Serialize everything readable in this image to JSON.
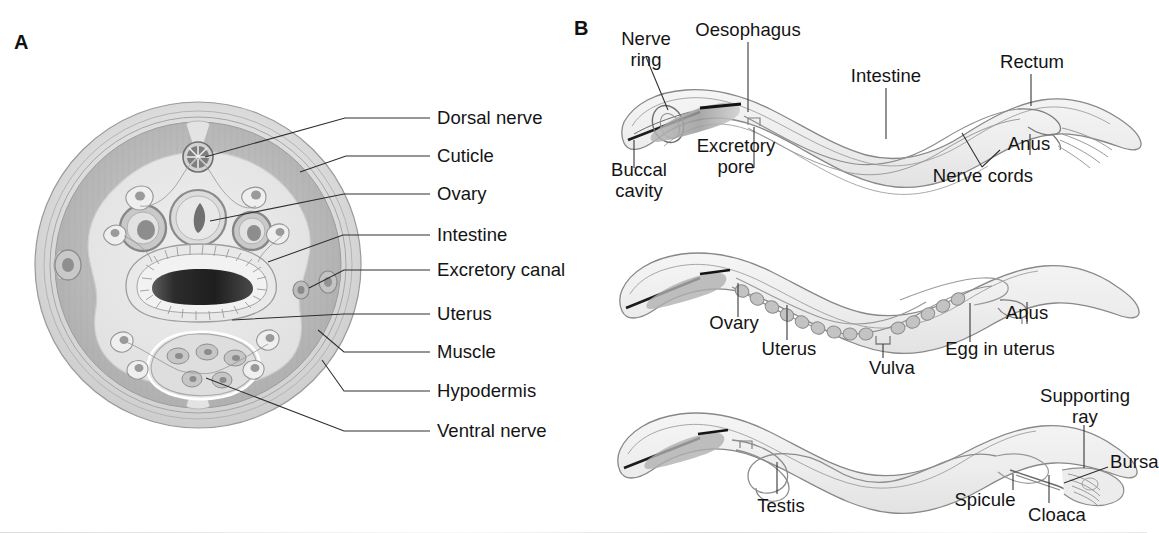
{
  "figure": {
    "background": "#ffffff",
    "panels": [
      {
        "letter": "A",
        "name": "nematode-cross-section",
        "labels": [
          {
            "key": "dorsal_nerve",
            "text": "Dorsal nerve"
          },
          {
            "key": "cuticle",
            "text": "Cuticle"
          },
          {
            "key": "ovary",
            "text": "Ovary"
          },
          {
            "key": "intestine",
            "text": "Intestine"
          },
          {
            "key": "excretory_canal",
            "text": "Excretory canal"
          },
          {
            "key": "uterus",
            "text": "Uterus"
          },
          {
            "key": "muscle",
            "text": "Muscle"
          },
          {
            "key": "hypodermis",
            "text": "Hypodermis"
          },
          {
            "key": "ventral_nerve",
            "text": "Ventral nerve"
          }
        ]
      },
      {
        "letter": "B",
        "name": "nematode-whole-worms",
        "worms": [
          {
            "key": "general-anatomy-worm",
            "labels": [
              {
                "key": "nerve_ring",
                "text": "Nerve\nring"
              },
              {
                "key": "oesophagus",
                "text": "Oesophagus"
              },
              {
                "key": "intestine",
                "text": "Intestine"
              },
              {
                "key": "rectum",
                "text": "Rectum"
              },
              {
                "key": "buccal_cavity",
                "text": "Buccal\ncavity"
              },
              {
                "key": "excretory_pore",
                "text": "Excretory\npore"
              },
              {
                "key": "nerve_cords",
                "text": "Nerve cords"
              },
              {
                "key": "anus",
                "text": "Anus"
              }
            ]
          },
          {
            "key": "female-worm",
            "labels": [
              {
                "key": "ovary",
                "text": "Ovary"
              },
              {
                "key": "uterus",
                "text": "Uterus"
              },
              {
                "key": "vulva",
                "text": "Vulva"
              },
              {
                "key": "egg_in_uterus",
                "text": "Egg in uterus"
              },
              {
                "key": "anus",
                "text": "Anus"
              }
            ]
          },
          {
            "key": "male-worm",
            "labels": [
              {
                "key": "testis",
                "text": "Testis"
              },
              {
                "key": "spicule",
                "text": "Spicule"
              },
              {
                "key": "cloaca",
                "text": "Cloaca"
              },
              {
                "key": "supporting_ray",
                "text": "Supporting\nray"
              },
              {
                "key": "bursa",
                "text": "Bursa"
              }
            ]
          }
        ]
      }
    ],
    "colors": {
      "ink": "#141414",
      "leader_line": "#2e2e2e",
      "outline": "#8e8e8e",
      "cuticle_fill": "#d9d9d9",
      "muscle_fill": "#c2c2c2",
      "body_cavity_fill": "#e6e6e6",
      "organ_fill": "#cfcfcf",
      "intestine_lumen": "#2a2a2a",
      "worm_body_fill": "#f0f0f0"
    }
  }
}
